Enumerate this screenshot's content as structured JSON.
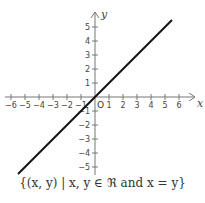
{
  "chart_data": {
    "type": "line",
    "title": "",
    "xlabel": "x",
    "ylabel": "y",
    "origin_label": "O",
    "xlim": [
      -6.5,
      7
    ],
    "ylim": [
      -6,
      6
    ],
    "x_ticks": [
      -6,
      -5,
      -4,
      -3,
      -2,
      -1,
      1,
      2,
      3,
      4,
      5,
      6
    ],
    "y_ticks": [
      -5,
      -4,
      -3,
      -2,
      -1,
      1,
      2,
      3,
      4,
      5
    ],
    "series": [
      {
        "name": "x = y",
        "points": [
          [
            -5.5,
            -5.5
          ],
          [
            5.5,
            5.5
          ]
        ]
      }
    ],
    "grid": false,
    "caption": "{(x, y) | x, y ∈ ℜ and x = y}"
  }
}
